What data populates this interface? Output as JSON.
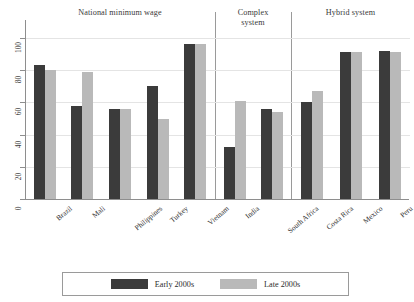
{
  "chart_data": {
    "type": "bar",
    "title": "",
    "xlabel": "",
    "ylabel": "",
    "ylim": [
      0,
      100
    ],
    "yticks": [
      0,
      20,
      40,
      60,
      80,
      100
    ],
    "grid": true,
    "legend_position": "bottom",
    "colors": {
      "early": "#3b3b3b",
      "late": "#b9b9b9",
      "axis": "#8e8e8e",
      "grid": "#e4e4e4",
      "divider": "#9a9a9a"
    },
    "series": [
      {
        "name": "Early 2000s",
        "values": [
          83,
          58,
          56,
          70,
          96,
          32,
          56,
          60,
          91,
          92
        ]
      },
      {
        "name": "Late 2000s",
        "values": [
          80,
          79,
          56,
          50,
          96,
          61,
          54,
          67,
          91,
          91
        ]
      }
    ],
    "categories": [
      "Brazil",
      "Mali",
      "Philippines",
      "Turkey",
      "Vietnam",
      "India",
      "South Africa",
      "Costa Rica",
      "Mexico",
      "Peru"
    ],
    "panels": [
      {
        "title": "National minimum wage",
        "title_lines": [
          "National minimum wage"
        ],
        "categories": [
          "Brazil",
          "Mali",
          "Philippines",
          "Turkey",
          "Vietnam"
        ]
      },
      {
        "title": "Complex system",
        "title_lines": [
          "Complex",
          "system"
        ],
        "categories": [
          "India",
          "South Africa"
        ]
      },
      {
        "title": "Hybrid system",
        "title_lines": [
          "Hybrid system"
        ],
        "categories": [
          "Costa Rica",
          "Mexico",
          "Peru"
        ]
      }
    ]
  },
  "legend": {
    "items": [
      {
        "label": "Early 2000s",
        "color": "#3b3b3b"
      },
      {
        "label": "Late 2000s",
        "color": "#b9b9b9"
      }
    ]
  },
  "axis": {
    "y_tick_labels": [
      "100",
      "80",
      "60",
      "40",
      "20",
      "0"
    ]
  }
}
